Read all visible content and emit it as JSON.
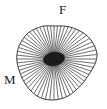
{
  "figure": {
    "background_color": "#ffffff",
    "width": 107,
    "height": 109
  },
  "labels": {
    "top": "F",
    "left": "M"
  },
  "chart_data": {
    "type": "scatter",
    "title": "",
    "xlabel": "",
    "ylabel": "",
    "annotations": [
      "F",
      "M"
    ],
    "center": {
      "x": 54,
      "y": 59
    },
    "core": {
      "shape": "ellipse",
      "rx": 11,
      "ry": 7,
      "rotation_deg": -8,
      "fill_color": "#1c1c1c"
    },
    "outline": {
      "closed": true,
      "stroke_color": "#262626",
      "stroke_width": 0.9,
      "fill_color": "none",
      "points": [
        [
          54,
          26
        ],
        [
          62,
          26
        ],
        [
          70,
          27
        ],
        [
          78,
          30
        ],
        [
          85,
          34
        ],
        [
          91,
          40
        ],
        [
          95,
          47
        ],
        [
          97,
          54
        ],
        [
          96,
          61
        ],
        [
          93,
          68
        ],
        [
          88,
          76
        ],
        [
          82,
          84
        ],
        [
          75,
          91
        ],
        [
          68,
          96
        ],
        [
          60,
          99
        ],
        [
          52,
          100
        ],
        [
          44,
          99
        ],
        [
          37,
          96
        ],
        [
          31,
          91
        ],
        [
          26,
          85
        ],
        [
          22,
          78
        ],
        [
          19,
          70
        ],
        [
          17,
          62
        ],
        [
          17,
          54
        ],
        [
          19,
          46
        ],
        [
          23,
          39
        ],
        [
          28,
          33
        ],
        [
          35,
          29
        ],
        [
          44,
          26
        ]
      ]
    },
    "rays": {
      "count": 60,
      "stroke_color": "#1f1f1f",
      "stroke_width": 0.65,
      "inner_radius_frac": 0.0,
      "outer_target": "outline",
      "angle_start_deg": 0,
      "angle_step_deg": 6
    },
    "grid": false,
    "legend": null
  }
}
